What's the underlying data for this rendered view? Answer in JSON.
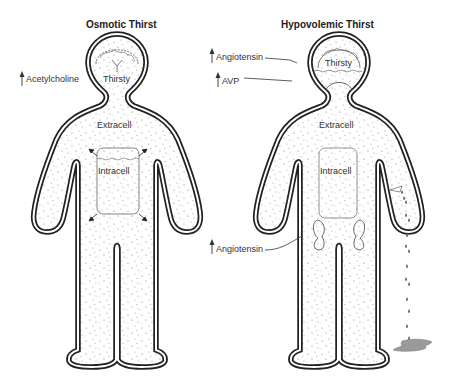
{
  "figures": [
    {
      "title": "Osmotic Thirst",
      "brain_label": "Thirsty",
      "extracellular_label": "Extracell",
      "intracellular_label": "Intracell",
      "annotations": [
        {
          "label": "Acetylcholine",
          "direction": "up"
        }
      ]
    },
    {
      "title": "Hypovolemic Thirst",
      "brain_label": "Thirsty",
      "extracellular_label": "Extracell",
      "intracellular_label": "Intracell",
      "annotations": [
        {
          "label": "Angiotensin",
          "direction": "up",
          "target": "brain"
        },
        {
          "label": "AVP",
          "direction": "up",
          "target": "pituitary"
        },
        {
          "label": "Angiotensin",
          "direction": "up",
          "target": "kidneys"
        }
      ],
      "fluid_loss": "dripping blood from arm into puddle"
    }
  ],
  "colors": {
    "outline": "#222222",
    "dots": "#777777",
    "puddle": "#9a9a9a",
    "text": "#333333"
  }
}
